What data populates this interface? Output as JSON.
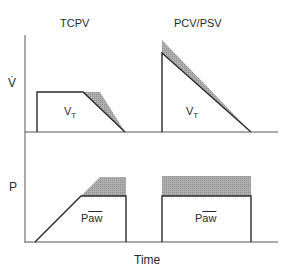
{
  "titles": {
    "left": "TCPV",
    "right": "PCV/PSV"
  },
  "axes": {
    "flow": "V̇",
    "pressure": "P",
    "x": "Time"
  },
  "labels": {
    "vt_main": "V",
    "vt_sub": "T",
    "paw_prefix": "P",
    "paw_over": "aw"
  },
  "colors": {
    "line": "#2a2a2a",
    "shade": "#a8a8a8",
    "background": "#ffffff"
  }
}
